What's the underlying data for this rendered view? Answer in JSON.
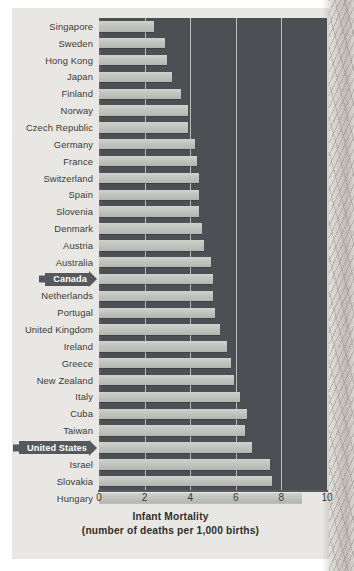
{
  "chart_data": {
    "type": "bar",
    "orientation": "horizontal",
    "title": "Infant Mortality",
    "subtitle": "(number of deaths per 1,000 births)",
    "xlabel": "Infant Mortality",
    "ylabel": "",
    "xlim": [
      0,
      10
    ],
    "xticks": [
      "0",
      "2",
      "4",
      "6",
      "8",
      "10"
    ],
    "xtick_values": [
      0,
      2,
      4,
      6,
      8,
      10
    ],
    "grid": true,
    "grid_axis": "x",
    "legend": null,
    "categories": [
      "Singapore",
      "Sweden",
      "Hong Kong",
      "Japan",
      "Finland",
      "Norway",
      "Czech Republic",
      "Germany",
      "France",
      "Switzerland",
      "Spain",
      "Slovenia",
      "Denmark",
      "Austria",
      "Australia",
      "Canada",
      "Netherlands",
      "Portugal",
      "United Kingdom",
      "Ireland",
      "Greece",
      "New Zealand",
      "Italy",
      "Cuba",
      "Taiwan",
      "United States",
      "Israel",
      "Slovakia",
      "Hungary"
    ],
    "values": [
      2.4,
      2.9,
      3.0,
      3.2,
      3.6,
      3.9,
      3.9,
      4.2,
      4.3,
      4.4,
      4.4,
      4.4,
      4.5,
      4.6,
      4.9,
      5.0,
      5.0,
      5.1,
      5.3,
      5.6,
      5.8,
      5.9,
      6.2,
      6.5,
      6.4,
      6.7,
      7.5,
      7.6,
      8.9
    ],
    "highlighted": [
      "Canada",
      "United States"
    ],
    "colors": {
      "plot_background": "#4c5054",
      "bar": "#c5c7c2",
      "gridline": "#cfd0cd",
      "page_background": "#e8e7e3",
      "label_text": "#3b3b39",
      "highlight_banner": "#55585c",
      "highlight_text": "#ffffff"
    }
  }
}
